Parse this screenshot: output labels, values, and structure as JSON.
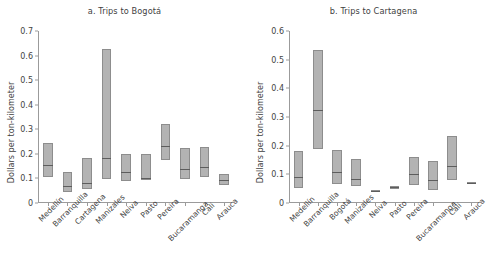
{
  "figure": {
    "ylabel": "Dollars per ton-kilometer"
  },
  "chart_data": [
    {
      "type": "bar",
      "id": "panel-a",
      "title": "a. Trips to Bogotá",
      "xlabel": "",
      "ylabel": "Dollars per ton-kilometer",
      "ylim": [
        0,
        0.7
      ],
      "yticks": [
        "0",
        "0.1",
        "0.2",
        "0.3",
        "0.4",
        "0.5",
        "0.6",
        "0.7"
      ],
      "ytick_values": [
        0,
        0.1,
        0.2,
        0.3,
        0.4,
        0.5,
        0.6,
        0.7
      ],
      "grid": false,
      "legend": "none",
      "categories": [
        "Medellín",
        "Barranquilla",
        "Cartagena",
        "Manizales",
        "Neiva",
        "Pasto",
        "Pereira",
        "Bucaramanga",
        "Cali",
        "Arauca"
      ],
      "series": [
        {
          "name": "low",
          "values": [
            0.105,
            0.045,
            0.055,
            0.098,
            0.09,
            0.093,
            0.175,
            0.098,
            0.105,
            0.075
          ]
        },
        {
          "name": "median",
          "values": [
            0.155,
            0.07,
            0.083,
            0.185,
            0.127,
            0.1,
            0.232,
            0.14,
            0.145,
            0.095
          ]
        },
        {
          "name": "high",
          "values": [
            0.245,
            0.125,
            0.185,
            0.625,
            0.2,
            0.2,
            0.322,
            0.225,
            0.228,
            0.118
          ]
        }
      ]
    },
    {
      "type": "bar",
      "id": "panel-b",
      "title": "b. Trips to Cartagena",
      "xlabel": "",
      "ylabel": "Dollars per ton-kilometer",
      "ylim": [
        0,
        0.6
      ],
      "yticks": [
        "0",
        "0.1",
        "0.2",
        "0.3",
        "0.4",
        "0.5",
        "0.6"
      ],
      "ytick_values": [
        0,
        0.1,
        0.2,
        0.3,
        0.4,
        0.5,
        0.6
      ],
      "grid": false,
      "legend": "none",
      "categories": [
        "Medellín",
        "Barranquilla",
        "Bogotá",
        "Manizales",
        "Neiva",
        "Pasto",
        "Pereira",
        "Bucaramanga",
        "Cali",
        "Arauca"
      ],
      "series": [
        {
          "name": "low",
          "values": [
            0.053,
            0.19,
            0.065,
            0.06,
            0.038,
            0.05,
            0.063,
            0.045,
            0.08,
            0.068
          ]
        },
        {
          "name": "median",
          "values": [
            0.09,
            0.325,
            0.108,
            0.083,
            0.041,
            0.056,
            0.102,
            0.08,
            0.128,
            0.07
          ]
        },
        {
          "name": "high",
          "values": [
            0.18,
            0.535,
            0.185,
            0.153,
            0.045,
            0.06,
            0.162,
            0.147,
            0.232,
            0.072
          ]
        }
      ]
    }
  ],
  "colors": {
    "box_fill": "#b3b3b3",
    "box_stroke": "#8d8d8d",
    "median": "#5d5d5d",
    "axis": "#9b9b9b",
    "text": "#3f3f3f",
    "background": "#ffffff"
  }
}
